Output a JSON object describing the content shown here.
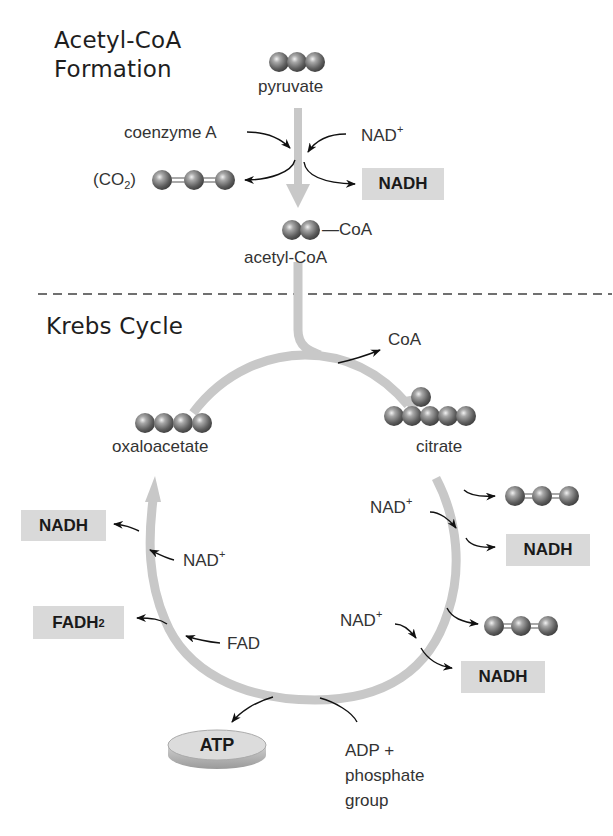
{
  "sections": {
    "acetyl_coa_formation": {
      "title_line1": "Acetyl-CoA",
      "title_line2": "Formation",
      "pyruvate": "pyruvate",
      "coenzyme_a": "coenzyme A",
      "nad_plus": "NAD",
      "nad_plus_sup": "+",
      "co2_open": "(CO",
      "co2_sub": "2",
      "co2_close": ")",
      "nadh": "NADH",
      "coa_tag": "—CoA",
      "acetyl_coa": "acetyl-CoA"
    },
    "krebs_cycle": {
      "title": "Krebs Cycle",
      "coa_released": "CoA",
      "oxaloacetate": "oxaloacetate",
      "citrate": "citrate",
      "right_nad_plus_1": "NAD",
      "right_nad_plus_1_sup": "+",
      "right_nadh_1": "NADH",
      "right_nad_plus_2": "NAD",
      "right_nad_plus_2_sup": "+",
      "right_nadh_2": "NADH",
      "left_nadh": "NADH",
      "left_nad_plus": "NAD",
      "left_nad_plus_sup": "+",
      "fadh2": "FADH",
      "fadh2_sub": "2",
      "fad": "FAD",
      "atp": "ATP",
      "adp_line1": "ADP +",
      "adp_line2": "phosphate",
      "adp_line3": "group"
    }
  },
  "colors": {
    "pathway_arrow": "#c8c8c8",
    "product_box": "#d9d9d9",
    "molecule_sphere": "#6e6e6e",
    "divider": "#707070",
    "text": "#333333"
  }
}
